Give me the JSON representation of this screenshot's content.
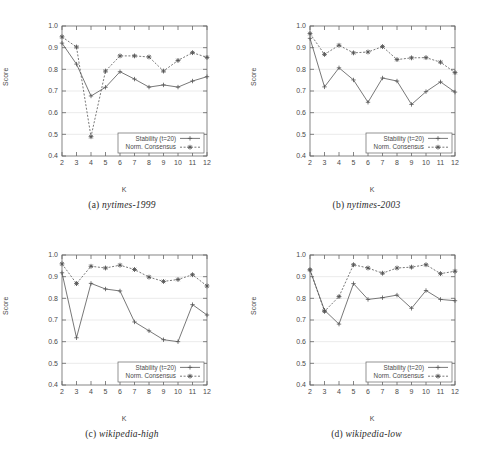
{
  "figure": {
    "axis": {
      "xlabel": "K",
      "ylabel": "Score",
      "xticks": [
        "2",
        "3",
        "4",
        "5",
        "6",
        "7",
        "8",
        "9",
        "10",
        "11",
        "12"
      ],
      "yticks": [
        "0.4",
        "0.5",
        "0.6",
        "0.7",
        "0.8",
        "0.9",
        "1.0"
      ],
      "xlim": [
        2,
        12
      ],
      "ylim": [
        0.4,
        1.0
      ]
    },
    "legend": {
      "stability_label": "Stability (t=20)",
      "consensus_label": "Norm. Consensus",
      "stability_marker": "plus-marker-icon",
      "consensus_marker": "star-marker-icon",
      "position": "lower-right"
    },
    "colors": {
      "stability": "#555555",
      "consensus": "#555555",
      "axis": "#666666",
      "grid": "#dddddd",
      "background": "#ffffff"
    },
    "captions": {
      "a": {
        "tag": "(a)",
        "name": "nytimes-1999"
      },
      "b": {
        "tag": "(b)",
        "name": "nytimes-2003"
      },
      "c": {
        "tag": "(c)",
        "name": "wikipedia-high"
      },
      "d": {
        "tag": "(d)",
        "name": "wikipedia-low"
      }
    }
  },
  "chart_data": [
    {
      "type": "line",
      "panel": "a",
      "title": "nytimes-1999",
      "xlabel": "K",
      "ylabel": "Score",
      "xlim": [
        2,
        12
      ],
      "ylim": [
        0.4,
        1.0
      ],
      "grid": true,
      "legend": "lower right",
      "x": [
        2,
        3,
        4,
        5,
        6,
        7,
        8,
        9,
        10,
        11,
        12
      ],
      "series": [
        {
          "name": "Stability (t=20)",
          "values": [
            0.921,
            0.824,
            0.677,
            0.717,
            0.789,
            0.755,
            0.718,
            0.728,
            0.718,
            0.746,
            0.766
          ]
        },
        {
          "name": "Norm. Consensus",
          "values": [
            0.95,
            0.903,
            0.489,
            0.792,
            0.862,
            0.862,
            0.857,
            0.792,
            0.841,
            0.877,
            0.855
          ]
        }
      ]
    },
    {
      "type": "line",
      "panel": "b",
      "title": "nytimes-2003",
      "xlabel": "K",
      "ylabel": "Score",
      "xlim": [
        2,
        12
      ],
      "ylim": [
        0.4,
        1.0
      ],
      "grid": true,
      "legend": "lower right",
      "x": [
        2,
        3,
        4,
        5,
        6,
        7,
        8,
        9,
        10,
        11,
        12
      ],
      "series": [
        {
          "name": "Stability (t=20)",
          "values": [
            0.943,
            0.719,
            0.807,
            0.751,
            0.648,
            0.76,
            0.746,
            0.638,
            0.697,
            0.742,
            0.695
          ]
        },
        {
          "name": "Norm. Consensus",
          "values": [
            0.965,
            0.869,
            0.911,
            0.876,
            0.88,
            0.905,
            0.845,
            0.853,
            0.854,
            0.833,
            0.785
          ]
        }
      ]
    },
    {
      "type": "line",
      "panel": "c",
      "title": "wikipedia-high",
      "xlabel": "K",
      "ylabel": "Score",
      "xlim": [
        2,
        12
      ],
      "ylim": [
        0.4,
        1.0
      ],
      "grid": true,
      "legend": "lower right",
      "x": [
        2,
        3,
        4,
        5,
        6,
        7,
        8,
        9,
        10,
        11,
        12
      ],
      "series": [
        {
          "name": "Stability (t=20)",
          "values": [
            0.918,
            0.618,
            0.869,
            0.843,
            0.834,
            0.691,
            0.65,
            0.609,
            0.6,
            0.771,
            0.723
          ]
        },
        {
          "name": "Norm. Consensus",
          "values": [
            0.959,
            0.868,
            0.948,
            0.94,
            0.953,
            0.933,
            0.898,
            0.878,
            0.887,
            0.909,
            0.857
          ]
        }
      ]
    },
    {
      "type": "line",
      "panel": "d",
      "title": "wikipedia-low",
      "xlabel": "K",
      "ylabel": "Score",
      "xlim": [
        2,
        12
      ],
      "ylim": [
        0.4,
        1.0
      ],
      "grid": true,
      "legend": "lower right",
      "x": [
        2,
        3,
        4,
        5,
        6,
        7,
        8,
        9,
        10,
        11,
        12
      ],
      "series": [
        {
          "name": "Stability (t=20)",
          "values": [
            0.93,
            0.745,
            0.681,
            0.868,
            0.795,
            0.803,
            0.815,
            0.754,
            0.836,
            0.795,
            0.789
          ]
        },
        {
          "name": "Norm. Consensus",
          "values": [
            0.932,
            0.74,
            0.808,
            0.955,
            0.94,
            0.916,
            0.94,
            0.944,
            0.955,
            0.914,
            0.925
          ]
        }
      ]
    }
  ]
}
